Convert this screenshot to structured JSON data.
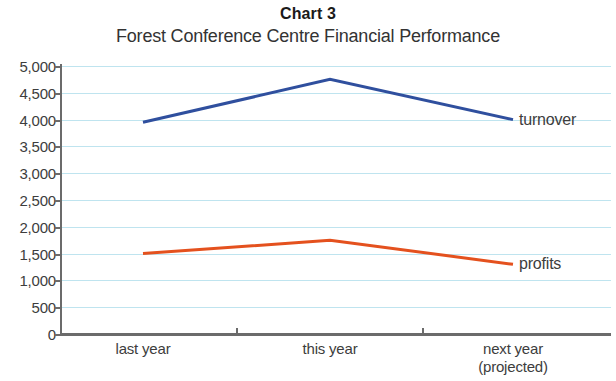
{
  "title": "Chart 3",
  "subtitle": "Forest Conference Centre Financial Performance",
  "colors": {
    "turnover": "#2f4f9e",
    "profits": "#e4511e",
    "gridline": "#bfe4ef",
    "axis": "#6b6b6b",
    "text": "#3d3d3d"
  },
  "series_labels": {
    "turnover": "turnover",
    "profits": "profits"
  },
  "chart_data": {
    "type": "line",
    "title": "Chart 3",
    "subtitle": "Forest Conference Centre Financial Performance",
    "xlabel": "",
    "ylabel": "",
    "categories": [
      "last year",
      "this year",
      "next year (projected)"
    ],
    "category_lines": [
      [
        "last year"
      ],
      [
        "this year"
      ],
      [
        "next year",
        "(projected)"
      ]
    ],
    "series": [
      {
        "name": "turnover",
        "color": "#2f4f9e",
        "values": [
          3950,
          4750,
          4000
        ]
      },
      {
        "name": "profits",
        "color": "#e4511e",
        "values": [
          1500,
          1750,
          1300
        ]
      }
    ],
    "ylim": [
      0,
      5000
    ],
    "ytick_step": 500,
    "ytick_labels": [
      "5,000",
      "4,500",
      "4,000",
      "3,500",
      "3,000",
      "2,500",
      "2,000",
      "1,500",
      "1,000",
      "500",
      "0"
    ],
    "ytick_values": [
      5000,
      4500,
      4000,
      3500,
      3000,
      2500,
      2000,
      1500,
      1000,
      500,
      0
    ],
    "grid": true,
    "legend": "inline-end-labels",
    "markers": false
  }
}
